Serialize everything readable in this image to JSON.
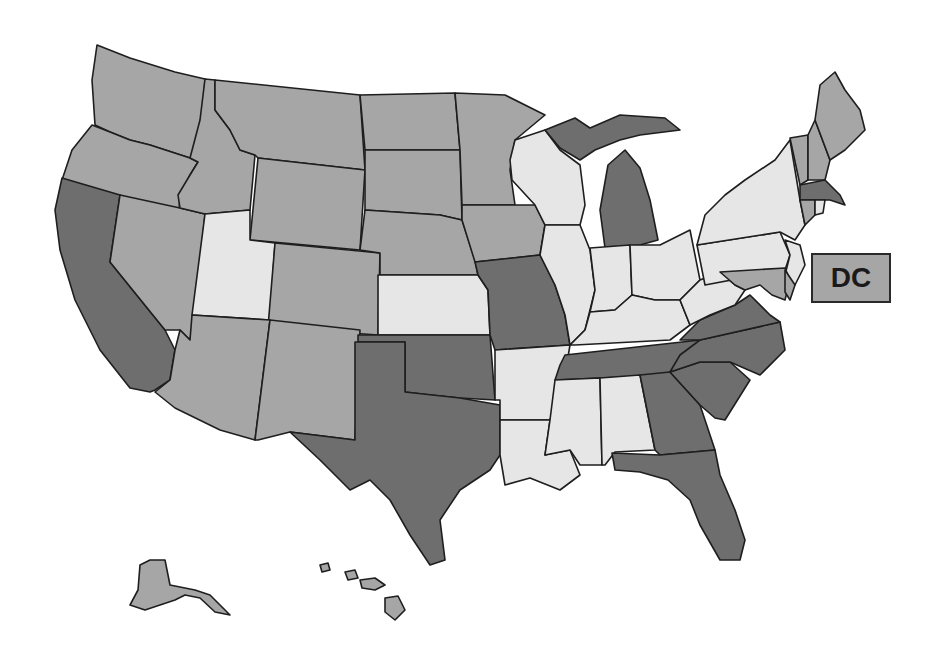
{
  "map": {
    "title": "",
    "shade_colors": {
      "light": "#e6e6e6",
      "medium": "#a6a6a6",
      "dark": "#6e6e6e"
    },
    "dc_label": "DC",
    "dc_shade": "medium",
    "states": [
      {
        "code": "WA",
        "shade": "medium",
        "points": "97,45 130,58 175,72 205,79 200,160 190,158 150,145 130,140 110,132 95,125 92,80"
      },
      {
        "code": "OR",
        "shade": "medium",
        "points": "92,125 110,132 130,140 150,145 190,158 198,162 190,175 180,195 178,232 120,218 70,205 62,180 72,150"
      },
      {
        "code": "CA",
        "shade": "dark",
        "points": "62,178 120,195 110,262 165,330 175,350 170,380 155,390 150,392 130,388 100,350 75,300 60,250 55,210"
      },
      {
        "code": "NV",
        "shade": "medium",
        "points": "120,195 180,208 205,214 195,315 190,340 180,330 165,330 110,262"
      },
      {
        "code": "ID",
        "shade": "medium",
        "points": "205,79 215,80 215,110 230,130 240,150 255,155 250,210 205,214 180,208 178,195 190,175 198,162 190,158 200,120"
      },
      {
        "code": "MT",
        "shade": "medium",
        "points": "215,80 360,95 365,170 258,158 255,155 240,150 230,130 215,110"
      },
      {
        "code": "WY",
        "shade": "medium",
        "points": "258,158 365,170 360,250 250,240"
      },
      {
        "code": "UT",
        "shade": "light",
        "points": "205,214 250,210 250,240 275,243 270,320 192,315"
      },
      {
        "code": "CO",
        "shade": "medium",
        "points": "275,243 380,253 378,335 268,327"
      },
      {
        "code": "AZ",
        "shade": "medium",
        "points": "192,315 270,320 255,440 220,430 175,408 155,392 170,380 175,350 180,330 190,340"
      },
      {
        "code": "NM",
        "shade": "medium",
        "points": "270,320 360,330 355,440 290,432 258,440 255,440"
      },
      {
        "code": "ND",
        "shade": "medium",
        "points": "360,95 455,93 460,150 365,150"
      },
      {
        "code": "SD",
        "shade": "medium",
        "points": "365,150 460,150 462,220 440,215 365,210"
      },
      {
        "code": "NE",
        "shade": "medium",
        "points": "365,210 440,215 462,220 475,260 478,275 380,275 380,253 360,250"
      },
      {
        "code": "KS",
        "shade": "light",
        "points": "378,275 478,275 488,290 490,335 378,335"
      },
      {
        "code": "OK",
        "shade": "dark",
        "points": "358,335 490,335 495,400 460,398 430,395 405,392 405,342 358,342"
      },
      {
        "code": "TX",
        "shade": "dark",
        "points": "355,342 405,342 405,392 460,398 500,405 500,455 490,470 460,490 440,520 445,560 430,565 410,535 390,500 370,480 350,490 320,460 290,432 355,440"
      },
      {
        "code": "MN",
        "shade": "medium",
        "points": "455,93 505,95 545,115 515,140 510,170 515,205 462,205 460,150"
      },
      {
        "code": "IA",
        "shade": "medium",
        "points": "462,205 535,205 545,225 540,255 475,262 462,220"
      },
      {
        "code": "MO",
        "shade": "dark",
        "points": "475,262 540,255 555,285 565,315 570,345 495,350 490,335 488,290 478,275"
      },
      {
        "code": "AR",
        "shade": "light",
        "points": "495,350 570,345 565,375 550,420 500,420 500,400 495,400"
      },
      {
        "code": "LA",
        "shade": "light",
        "points": "500,420 550,420 545,455 570,450 580,475 560,490 530,478 505,485 500,455"
      },
      {
        "code": "WI",
        "shade": "light",
        "points": "515,140 545,130 560,150 580,165 585,205 580,225 545,225 535,205 512,180 510,160"
      },
      {
        "code": "IL",
        "shade": "light",
        "points": "545,225 580,225 590,250 595,290 585,330 570,345 565,315 555,285 540,255"
      },
      {
        "code": "MI",
        "shade": "dark",
        "points": "608,165 625,150 640,168 650,200 658,240 640,245 605,248 600,210"
      },
      {
        "code": "MI-UP",
        "shade": "dark",
        "points": "545,130 575,118 590,128 620,115 665,118 680,130 640,135 620,140 595,150 580,160 560,148"
      },
      {
        "code": "IN",
        "shade": "light",
        "points": "590,248 630,245 632,295 615,310 590,312 595,290"
      },
      {
        "code": "OH",
        "shade": "light",
        "points": "630,245 660,245 690,230 700,280 680,300 655,300 632,295"
      },
      {
        "code": "KY",
        "shade": "light",
        "points": "570,345 585,330 590,312 615,310 632,295 655,300 680,300 690,325 670,340 575,345"
      },
      {
        "code": "TN",
        "shade": "dark",
        "points": "565,355 700,340 690,355 670,375 555,380 560,365"
      },
      {
        "code": "MS",
        "shade": "light",
        "points": "555,380 600,378 602,465 580,465 570,450 545,455 550,420"
      },
      {
        "code": "AL",
        "shade": "light",
        "points": "600,378 640,375 655,450 615,452 605,465 602,465"
      },
      {
        "code": "GA",
        "shade": "dark",
        "points": "640,375 670,372 700,405 715,450 660,455 655,450"
      },
      {
        "code": "FL",
        "shade": "dark",
        "points": "612,453 660,455 715,450 720,475 735,510 745,540 740,560 720,560 700,525 690,500 668,480 640,472 615,470"
      },
      {
        "code": "SC",
        "shade": "dark",
        "points": "670,372 700,362 730,362 750,380 725,420 715,418 700,405"
      },
      {
        "code": "NC",
        "shade": "dark",
        "points": "700,340 780,322 785,350 760,375 730,362 700,362 670,372 680,355"
      },
      {
        "code": "VA",
        "shade": "dark",
        "points": "680,340 700,320 735,305 750,295 770,315 780,322 700,340"
      },
      {
        "code": "WV",
        "shade": "light",
        "points": "690,290 700,280 720,272 735,285 745,290 735,305 710,315 690,325 680,300"
      },
      {
        "code": "PA",
        "shade": "light",
        "points": "697,245 780,232 790,255 785,270 705,285 700,260"
      },
      {
        "code": "NY",
        "shade": "light",
        "points": "705,215 725,195 745,180 775,160 790,140 800,200 805,225 795,240 780,232 697,245"
      },
      {
        "code": "NJ",
        "shade": "light",
        "points": "785,240 800,245 805,265 795,285 785,275 790,255"
      },
      {
        "code": "MD",
        "shade": "medium",
        "points": "720,272 785,268 790,280 785,300 772,295 760,285 745,290 735,285"
      },
      {
        "code": "DE",
        "shade": "medium",
        "points": "785,270 795,285 790,300 785,292"
      },
      {
        "code": "VT",
        "shade": "medium",
        "points": "790,138 808,135 808,180 800,185"
      },
      {
        "code": "NH",
        "shade": "medium",
        "points": "808,135 815,120 830,160 825,180 808,180"
      },
      {
        "code": "ME",
        "shade": "medium",
        "points": "815,120 820,85 835,72 845,90 860,110 865,130 845,150 830,160"
      },
      {
        "code": "MA",
        "shade": "dark",
        "points": "800,185 825,180 840,195 845,205 830,200 800,200"
      },
      {
        "code": "CT",
        "shade": "medium",
        "points": "800,200 815,200 815,215 805,225"
      },
      {
        "code": "RI",
        "shade": "light",
        "points": "815,200 825,200 823,213 815,215"
      },
      {
        "code": "AK",
        "shade": "medium",
        "points": "140,565 150,560 165,560 170,585 195,590 210,595 225,610 230,615 215,612 200,598 185,595 175,600 160,605 145,610 130,605 138,590"
      },
      {
        "code": "HI-1",
        "shade": "medium",
        "points": "320,565 328,563 330,570 322,572"
      },
      {
        "code": "HI-2",
        "shade": "medium",
        "points": "345,572 355,570 358,578 348,580"
      },
      {
        "code": "HI-3",
        "shade": "medium",
        "points": "360,580 375,578 385,585 375,590 362,588"
      },
      {
        "code": "HI-4",
        "shade": "medium",
        "points": "385,598 398,596 405,610 395,620 385,612"
      }
    ]
  }
}
